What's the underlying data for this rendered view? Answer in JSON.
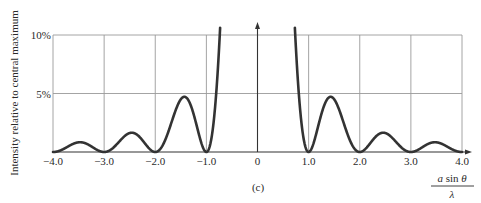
{
  "chart_data": {
    "type": "line",
    "title": "",
    "caption": "(c)",
    "xlabel": {
      "numerator": "a sin θ",
      "numerator_parts": [
        "a",
        " sin ",
        "θ"
      ],
      "denominator": "λ"
    },
    "ylabel": "Intensity relative to central maximum",
    "xlim": [
      -4.0,
      4.0
    ],
    "ylim": [
      0,
      10
    ],
    "y_unit": "%",
    "grid": true,
    "x_ticks": [
      {
        "value": -4.0,
        "label": "−4.0"
      },
      {
        "value": -3.0,
        "label": "−3.0"
      },
      {
        "value": -2.0,
        "label": "−2.0"
      },
      {
        "value": -1.0,
        "label": "−1.0"
      },
      {
        "value": 0,
        "label": "0"
      },
      {
        "value": 1.0,
        "label": "1.0"
      },
      {
        "value": 2.0,
        "label": "2.0"
      },
      {
        "value": 3.0,
        "label": "3.0"
      },
      {
        "value": 4.0,
        "label": "4.0"
      }
    ],
    "y_ticks": [
      {
        "value": 5,
        "label": "5%"
      },
      {
        "value": 10,
        "label": "10%"
      }
    ],
    "series": [
      {
        "name": "Single-slit intensity (sin(πx)/(πx))²",
        "color": "#333333",
        "x": [
          -4.0,
          -3.5,
          -3.0,
          -2.46,
          -2.0,
          -1.43,
          -1.0,
          0,
          1.0,
          1.43,
          2.0,
          2.46,
          3.0,
          3.5,
          4.0
        ],
        "y": [
          0,
          0.8,
          0,
          1.6,
          0,
          4.7,
          0,
          100,
          0,
          4.7,
          0,
          1.6,
          0,
          0.8,
          0
        ]
      }
    ],
    "annotations": [
      "Central maximum extends off-scale above 10%"
    ]
  },
  "colors": {
    "curve": "#333333",
    "grid": "#9a9a9a",
    "axis": "#333333",
    "text": "#2a2a2a"
  }
}
